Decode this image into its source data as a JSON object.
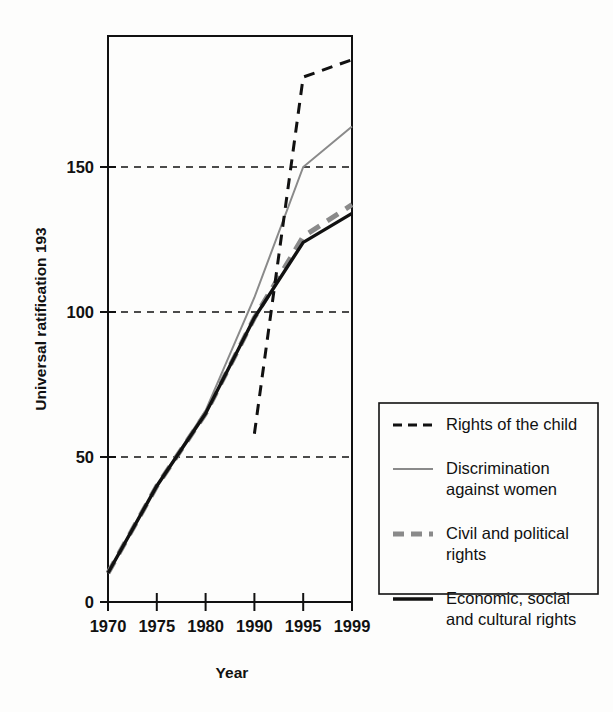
{
  "chart_data": {
    "type": "line",
    "title": "",
    "xlabel": "Year",
    "ylabel": "Universal ratification 193",
    "x": [
      "1970",
      "1975",
      "1980",
      "1990",
      "1995",
      "1999"
    ],
    "x_tick_labels": [
      "1970",
      "1975",
      "1980",
      "1990",
      "1995",
      "1999"
    ],
    "y_tick_labels": [
      "0",
      "50",
      "100",
      "150"
    ],
    "y_ticks": [
      0,
      50,
      100,
      150
    ],
    "ylim": [
      0,
      195
    ],
    "grid": "horizontal-dashed",
    "legend_position": "right-outside-lower",
    "series": [
      {
        "name": "Rights of the child",
        "style": "dashed",
        "color": "#111111",
        "width": 3,
        "x": [
          "1990",
          "1995",
          "1999"
        ],
        "values": [
          58,
          181,
          187
        ]
      },
      {
        "name": "Discrimination against women",
        "style": "solid",
        "color": "#8a8a8a",
        "width": 2,
        "x": [
          "1970",
          "1975",
          "1980",
          "1990",
          "1995",
          "1999"
        ],
        "values": [
          10,
          40,
          66,
          105,
          150,
          164
        ]
      },
      {
        "name": "Civil and political rights",
        "style": "dashed",
        "color": "#8a8a8a",
        "width": 5,
        "x": [
          "1970",
          "1975",
          "1980",
          "1990",
          "1995",
          "1999"
        ],
        "values": [
          10,
          40,
          65,
          98,
          126,
          137
        ]
      },
      {
        "name": "Economic, social and cultural rights",
        "style": "solid",
        "color": "#111111",
        "width": 3.4,
        "x": [
          "1970",
          "1975",
          "1980",
          "1990",
          "1995",
          "1999"
        ],
        "values": [
          10,
          40,
          65,
          98,
          124,
          134
        ]
      }
    ]
  },
  "legend": {
    "entries": [
      {
        "label_line1": "Rights of the child",
        "label_line2": ""
      },
      {
        "label_line1": "Discrimination",
        "label_line2": "against women"
      },
      {
        "label_line1": "Civil and political",
        "label_line2": "rights"
      },
      {
        "label_line1": "Economic, social",
        "label_line2": "and cultural rights"
      }
    ]
  }
}
